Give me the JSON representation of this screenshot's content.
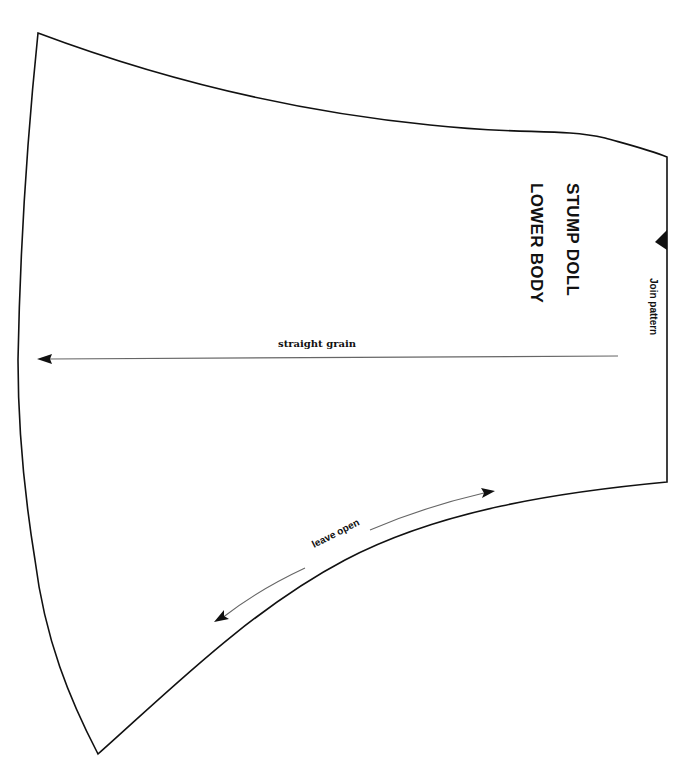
{
  "pattern": {
    "title_line_1": "STUMP DOLL",
    "title_line_2": "LOWER BODY",
    "join_label": "Join pattern",
    "grain_label": "straight grain",
    "opening_label": "leave open",
    "colors": {
      "background": "#ffffff",
      "line": "#111111",
      "arrow": "#555555"
    },
    "markers": {
      "join_notch": "triangle-notch",
      "grain_arrow": "arrow-left",
      "opening_arrow": "double-headed-arrow"
    }
  }
}
